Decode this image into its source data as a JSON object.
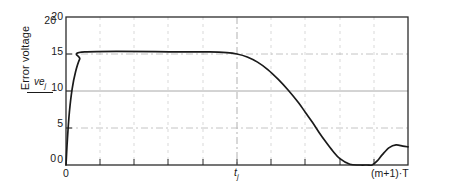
{
  "chart_data": {
    "type": "line",
    "title": "",
    "xlabel": "",
    "ylabel": "Error voltage",
    "ylabel_symbol_numerator": "ve",
    "ylabel_symbol_subscript": "j",
    "ylim": [
      0,
      20
    ],
    "xlim": [
      0,
      1
    ],
    "grid": true,
    "legend": null,
    "y_ticks": [
      0,
      5,
      10,
      15,
      20
    ],
    "y_tick_labels": [
      "0",
      "5",
      "10",
      "15",
      "20"
    ],
    "y_ticks_duplicate": [
      0,
      20
    ],
    "y_tick_labels_duplicate": [
      "0",
      "20"
    ],
    "x_tick_labels": [
      "0",
      "t",
      "(m+1)·T"
    ],
    "x_tick_label_right_plain": "(m+1)·T",
    "x_tick_label_mid_base": "t",
    "x_tick_label_mid_sub": "j",
    "x_tick_positions": [
      0.0,
      0.5,
      1.0
    ],
    "series": [
      {
        "name": "error-voltage",
        "color": "#1a1a1a",
        "x": [
          0.0,
          0.004,
          0.01,
          0.018,
          0.028,
          0.04,
          0.055,
          0.33,
          0.42,
          0.47,
          0.5,
          0.53,
          0.56,
          0.59,
          0.62,
          0.65,
          0.68,
          0.7,
          0.72,
          0.74,
          0.76,
          0.78,
          0.8,
          0.83,
          0.86,
          0.88,
          0.895,
          0.91,
          0.925,
          0.945,
          0.965,
          0.985,
          1.0
        ],
        "y": [
          0.0,
          3.4,
          7.2,
          10.3,
          12.6,
          14.3,
          15.28,
          15.3,
          15.28,
          15.18,
          15.0,
          14.6,
          13.9,
          12.9,
          11.6,
          10.1,
          8.4,
          7.1,
          5.8,
          4.4,
          3.1,
          1.9,
          0.9,
          0.1,
          0.0,
          0.0,
          0.0,
          0.55,
          1.4,
          2.35,
          2.72,
          2.55,
          2.45
        ]
      }
    ]
  },
  "axes": {
    "y_outer_top_label": "20",
    "y_outer_bottom_label": "0",
    "y_labels": [
      "20",
      "15",
      "10",
      "5",
      "0"
    ],
    "y_title": "Error voltage",
    "x_left_label": "0",
    "x_mid_label_base": "t",
    "x_mid_label_sub": "j",
    "x_right_label": "(m+1)·T"
  },
  "style": {
    "line_color": "#1a1a1a",
    "frame_color": "#2b2b2b",
    "grid_major_color": "#9a9a9a",
    "grid_minor_color": "#c9c9c9",
    "background": "#ffffff"
  }
}
